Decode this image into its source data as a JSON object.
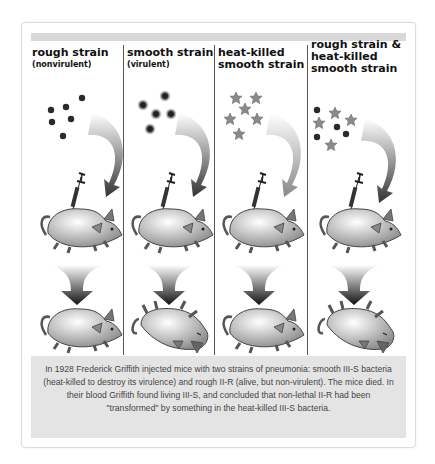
{
  "columns": [
    {
      "heading": "rough strain",
      "subheading": "(nonvirulent)",
      "result": "mouse lives",
      "inoculum": "live rough bacteria (dots)",
      "outcome": "alive"
    },
    {
      "heading": "smooth strain",
      "subheading": "(virulent)",
      "result": "mouse dies",
      "inoculum": "live smooth bacteria (encapsulated dots)",
      "outcome": "dead"
    },
    {
      "heading": "heat-killed",
      "heading2": "smooth strain",
      "result": "mouse lives",
      "inoculum": "heat-killed smooth bacteria (stars)",
      "outcome": "alive"
    },
    {
      "heading": "rough strain &",
      "heading2": "heat-killed",
      "heading3": "smooth strain",
      "result": "mouse dies",
      "inoculum": "rough bacteria + heat-killed smooth (dots and stars)",
      "outcome": "dead"
    }
  ],
  "caption": "In 1928 Frederick Griffith injected mice with two strains of pneumonia: smooth III-S bacteria (heat-killed to destroy its virulence) and rough II-R (alive, but non-virulent). The mice died. In their blood Griffith found living III-S, and concluded that non-lethal II-R had been \"transformed\" by something in the heat-killed III-S bacteria.",
  "colors": {
    "frame_border": "#dcdcdc",
    "band": "#d9d9d9",
    "caption_bg": "#e4e4e4",
    "divider": "#555555",
    "bacteria": "#2a2a2a",
    "star": "#8a8a8a",
    "mouse": "#b8b8b8"
  }
}
